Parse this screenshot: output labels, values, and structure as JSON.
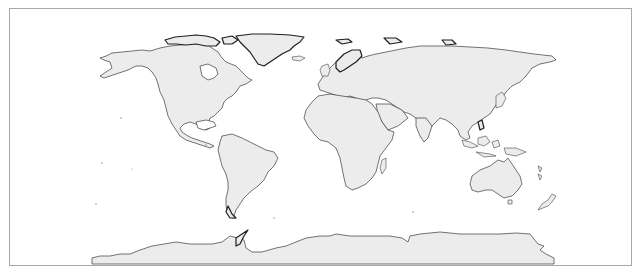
{
  "map": {
    "projection": "equirectangular",
    "style": "grayscale coastlines",
    "land_color": "#ececec",
    "coast_color": "#333333",
    "frame_color": "#a8a8a8",
    "background": "#ffffff",
    "regions": [
      {
        "name": "North America"
      },
      {
        "name": "Greenland"
      },
      {
        "name": "South America"
      },
      {
        "name": "Europe"
      },
      {
        "name": "Africa"
      },
      {
        "name": "Asia"
      },
      {
        "name": "Australia"
      },
      {
        "name": "New Zealand"
      },
      {
        "name": "Madagascar"
      },
      {
        "name": "Antarctica"
      }
    ]
  }
}
